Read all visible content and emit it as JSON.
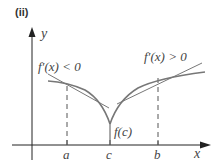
{
  "figure": {
    "panel_label": "(ii)",
    "axes": {
      "x_label": "x",
      "y_label": "y"
    },
    "ticks": {
      "a": "a",
      "c": "c",
      "b": "b"
    },
    "annotations": {
      "cusp_value": "f(c)",
      "left_derivative": "f′(x) < 0",
      "right_derivative": "f′(x) > 0"
    },
    "colors": {
      "curve": "#777777",
      "axis": "#222222",
      "text": "#444444"
    }
  }
}
